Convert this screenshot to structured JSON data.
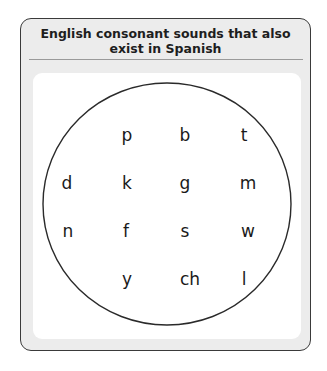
{
  "title": {
    "line1": "English consonant sounds that also",
    "line2": "exist in Spanish"
  },
  "circle": {
    "cx": 167,
    "cy": 204,
    "rx": 124,
    "ry": 121,
    "stroke": "#2a2a2a"
  },
  "sounds": [
    {
      "label": "p",
      "x": 127,
      "y": 135
    },
    {
      "label": "b",
      "x": 185,
      "y": 135
    },
    {
      "label": "t",
      "x": 244,
      "y": 135
    },
    {
      "label": "d",
      "x": 67,
      "y": 183
    },
    {
      "label": "k",
      "x": 127,
      "y": 183
    },
    {
      "label": "g",
      "x": 185,
      "y": 183
    },
    {
      "label": "m",
      "x": 248,
      "y": 183
    },
    {
      "label": "n",
      "x": 68,
      "y": 231
    },
    {
      "label": "f",
      "x": 126,
      "y": 231
    },
    {
      "label": "s",
      "x": 185,
      "y": 231
    },
    {
      "label": "w",
      "x": 248,
      "y": 231
    },
    {
      "label": "y",
      "x": 127,
      "y": 279
    },
    {
      "label": "ch",
      "x": 190,
      "y": 279
    },
    {
      "label": "l",
      "x": 244,
      "y": 279
    }
  ]
}
